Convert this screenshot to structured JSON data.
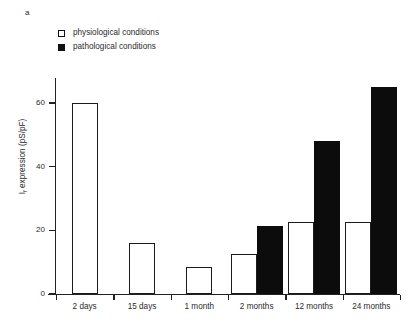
{
  "figure": {
    "panel_label": "a"
  },
  "legend": {
    "items": [
      {
        "label": "physiological conditions",
        "swatch": "open-square-icon",
        "color": "#ffffff"
      },
      {
        "label": "pathological conditions",
        "swatch": "filled-square-icon",
        "color": "#0c0c0c"
      }
    ]
  },
  "chart_data": {
    "type": "bar",
    "title": "",
    "subtitle": "",
    "xlabel": "",
    "ylabel": "I_f expression (pS/pF)",
    "ylabel_main": "expression (pS/pF)",
    "ylabel_symbol": "I",
    "ylabel_subscript": "f",
    "categories": [
      "2 days",
      "15 days",
      "1 month",
      "2 months",
      "12 months",
      "24 months"
    ],
    "series": [
      {
        "name": "physiological conditions",
        "color": "#ffffff",
        "edge_color": "#1b1b1b",
        "values": [
          60,
          16,
          8.5,
          12.5,
          22.5,
          22.5
        ]
      },
      {
        "name": "pathological conditions",
        "color": "#0c0c0c",
        "edge_color": "#0c0c0c",
        "values": [
          null,
          null,
          null,
          21.5,
          48,
          65
        ]
      }
    ],
    "ylim": [
      0,
      70
    ],
    "yticks": [
      0,
      20,
      40,
      60
    ],
    "ytick_labels": [
      "0",
      "20",
      "40",
      "60"
    ],
    "grid": false,
    "legend_position": "top-left",
    "axis_spines": [
      "left",
      "bottom"
    ]
  }
}
